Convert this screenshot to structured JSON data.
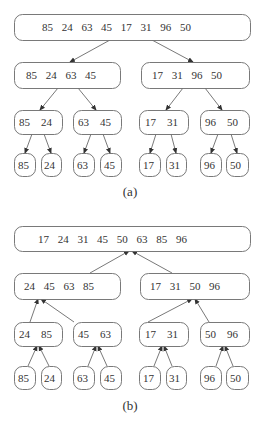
{
  "diagram": {
    "colors": {
      "stroke": "#6a6a6a",
      "text": "#333333",
      "edge": "#555555",
      "background": "#ffffff"
    },
    "panels": [
      {
        "id": "a",
        "caption": "(a)",
        "caption_pos": [
          130,
          196
        ],
        "direction": "down",
        "nodes": [
          {
            "id": "a0",
            "values": [
              "85",
              "24",
              "63",
              "45",
              "17",
              "31",
              "96",
              "50"
            ],
            "box": [
              14,
              14,
              236,
              26
            ],
            "text_x": 42
          },
          {
            "id": "a1",
            "values": [
              "85",
              "24",
              "63",
              "45"
            ],
            "box": [
              14,
              62,
              106,
              26
            ],
            "text_x": 26
          },
          {
            "id": "a2",
            "values": [
              "17",
              "31",
              "96",
              "50"
            ],
            "box": [
              141,
              62,
              108,
              26
            ],
            "text_x": 152
          },
          {
            "id": "a3",
            "values": [
              "85",
              "24"
            ],
            "box": [
              14,
              110,
              48,
              24
            ],
            "text_x": 19
          },
          {
            "id": "a4",
            "values": [
              "63",
              "45"
            ],
            "box": [
              73,
              110,
              48,
              24
            ],
            "text_x": 78
          },
          {
            "id": "a5",
            "values": [
              "17",
              "31"
            ],
            "box": [
              139,
              110,
              49,
              24
            ],
            "text_x": 145
          },
          {
            "id": "a6",
            "values": [
              "96",
              "50"
            ],
            "box": [
              200,
              110,
              49,
              24
            ],
            "text_x": 205
          },
          {
            "id": "a7",
            "values": [
              "85"
            ],
            "box": [
              14,
              153,
              21,
              23
            ],
            "text_x": 18
          },
          {
            "id": "a8",
            "values": [
              "24"
            ],
            "box": [
              41,
              153,
              20,
              23
            ],
            "text_x": 44
          },
          {
            "id": "a9",
            "values": [
              "63"
            ],
            "box": [
              73,
              153,
              21,
              23
            ],
            "text_x": 77
          },
          {
            "id": "a10",
            "values": [
              "45"
            ],
            "box": [
              100,
              153,
              21,
              23
            ],
            "text_x": 104
          },
          {
            "id": "a11",
            "values": [
              "17"
            ],
            "box": [
              139,
              153,
              21,
              23
            ],
            "text_x": 143
          },
          {
            "id": "a12",
            "values": [
              "31"
            ],
            "box": [
              166,
              153,
              20,
              23
            ],
            "text_x": 169
          },
          {
            "id": "a13",
            "values": [
              "96"
            ],
            "box": [
              200,
              153,
              21,
              23
            ],
            "text_x": 204
          },
          {
            "id": "a14",
            "values": [
              "50"
            ],
            "box": [
              226,
              153,
              22,
              23
            ],
            "text_x": 230
          }
        ],
        "edges": [
          {
            "from": [
              110,
              40
            ],
            "to": [
              70,
              62
            ]
          },
          {
            "from": [
              152,
              40
            ],
            "to": [
              193,
              62
            ]
          },
          {
            "from": [
              58,
              88
            ],
            "to": [
              40,
              110
            ]
          },
          {
            "from": [
              78,
              88
            ],
            "to": [
              96,
              110
            ]
          },
          {
            "from": [
              183,
              88
            ],
            "to": [
              166,
              110
            ]
          },
          {
            "from": [
              205,
              88
            ],
            "to": [
              222,
              110
            ]
          },
          {
            "from": [
              32,
              134
            ],
            "to": [
              25,
              153
            ]
          },
          {
            "from": [
              44,
              134
            ],
            "to": [
              51,
              153
            ]
          },
          {
            "from": [
              91,
              134
            ],
            "to": [
              84,
              153
            ]
          },
          {
            "from": [
              103,
              134
            ],
            "to": [
              110,
              153
            ]
          },
          {
            "from": [
              156,
              134
            ],
            "to": [
              150,
              153
            ]
          },
          {
            "from": [
              171,
              134
            ],
            "to": [
              176,
              153
            ]
          },
          {
            "from": [
              218,
              134
            ],
            "to": [
              211,
              153
            ]
          },
          {
            "from": [
              231,
              134
            ],
            "to": [
              237,
              153
            ]
          }
        ]
      },
      {
        "id": "b",
        "caption": "(b)",
        "caption_pos": [
          130,
          410
        ],
        "direction": "up",
        "nodes": [
          {
            "id": "b0",
            "values": [
              "17",
              "24",
              "31",
              "45",
              "50",
              "63",
              "85",
              "96"
            ],
            "box": [
              14,
              226,
              236,
              25
            ],
            "text_x": 38
          },
          {
            "id": "b1",
            "values": [
              "24",
              "45",
              "63",
              "85"
            ],
            "box": [
              14,
              273,
              106,
              26
            ],
            "text_x": 24
          },
          {
            "id": "b2",
            "values": [
              "17",
              "31",
              "50",
              "96"
            ],
            "box": [
              140,
              273,
              109,
              26
            ],
            "text_x": 150
          },
          {
            "id": "b3",
            "values": [
              "24",
              "85"
            ],
            "box": [
              14,
              322,
              48,
              24
            ],
            "text_x": 19
          },
          {
            "id": "b4",
            "values": [
              "45",
              "63"
            ],
            "box": [
              73,
              322,
              48,
              24
            ],
            "text_x": 78
          },
          {
            "id": "b5",
            "values": [
              "17",
              "31"
            ],
            "box": [
              139,
              322,
              49,
              24
            ],
            "text_x": 145
          },
          {
            "id": "b6",
            "values": [
              "50",
              "96"
            ],
            "box": [
              200,
              322,
              49,
              24
            ],
            "text_x": 205
          },
          {
            "id": "b7",
            "values": [
              "85"
            ],
            "box": [
              14,
              366,
              21,
              23
            ],
            "text_x": 18
          },
          {
            "id": "b8",
            "values": [
              "24"
            ],
            "box": [
              41,
              366,
              20,
              23
            ],
            "text_x": 44
          },
          {
            "id": "b9",
            "values": [
              "63"
            ],
            "box": [
              73,
              366,
              21,
              23
            ],
            "text_x": 77
          },
          {
            "id": "b10",
            "values": [
              "45"
            ],
            "box": [
              100,
              366,
              21,
              23
            ],
            "text_x": 104
          },
          {
            "id": "b11",
            "values": [
              "17"
            ],
            "box": [
              139,
              366,
              21,
              23
            ],
            "text_x": 143
          },
          {
            "id": "b12",
            "values": [
              "31"
            ],
            "box": [
              166,
              366,
              20,
              23
            ],
            "text_x": 169
          },
          {
            "id": "b13",
            "values": [
              "96"
            ],
            "box": [
              200,
              366,
              21,
              23
            ],
            "text_x": 204
          },
          {
            "id": "b14",
            "values": [
              "50"
            ],
            "box": [
              226,
              366,
              22,
              23
            ],
            "text_x": 230
          }
        ],
        "edges": [
          {
            "from": [
              90,
              273
            ],
            "to": [
              129,
              251
            ]
          },
          {
            "from": [
              172,
              273
            ],
            "to": [
              132,
              251
            ]
          },
          {
            "from": [
              30,
              322
            ],
            "to": [
              38,
              299
            ]
          },
          {
            "from": [
              74,
              322
            ],
            "to": [
              41,
              299
            ]
          },
          {
            "from": [
              148,
              322
            ],
            "to": [
              192,
              299
            ]
          },
          {
            "from": [
              209,
              322
            ],
            "to": [
              195,
              299
            ]
          },
          {
            "from": [
              28,
              366
            ],
            "to": [
              37,
              346
            ]
          },
          {
            "from": [
              49,
              366
            ],
            "to": [
              39,
              346
            ]
          },
          {
            "from": [
              88,
              366
            ],
            "to": [
              96,
              346
            ]
          },
          {
            "from": [
              107,
              366
            ],
            "to": [
              98,
              346
            ]
          },
          {
            "from": [
              154,
              366
            ],
            "to": [
              162,
              346
            ]
          },
          {
            "from": [
              172,
              366
            ],
            "to": [
              164,
              346
            ]
          },
          {
            "from": [
              216,
              366
            ],
            "to": [
              223,
              346
            ]
          },
          {
            "from": [
              233,
              366
            ],
            "to": [
              225,
              346
            ]
          }
        ]
      }
    ],
    "footer_partial_text": "..."
  }
}
